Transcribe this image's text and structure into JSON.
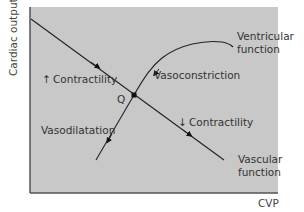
{
  "diagram": {
    "axes": {
      "ylabel": "Cardiac output",
      "xlabel": "CVP"
    },
    "colors": {
      "plot_background": "#c8c8c8",
      "line": "#222222",
      "border": "#555555",
      "text": "#333333"
    },
    "curves": [
      {
        "id": "vascular",
        "label_line1": "Vascular",
        "label_line2": "function",
        "shape": "straight line descending"
      },
      {
        "id": "ventricular",
        "label_line1": "Ventricular",
        "label_line2": "function",
        "shape": "rising curve that plateaus"
      }
    ],
    "point": {
      "label": "Q",
      "meaning": "intersection of ventricular and vascular function curves"
    },
    "annotations": {
      "up_contractility": {
        "arrow": "↑",
        "text": "Contractility"
      },
      "down_contractility": {
        "arrow": "↓",
        "text": "Contractility"
      },
      "vasoconstriction": "Vasoconstriction",
      "vasodilatation": "Vasodilatation"
    }
  }
}
